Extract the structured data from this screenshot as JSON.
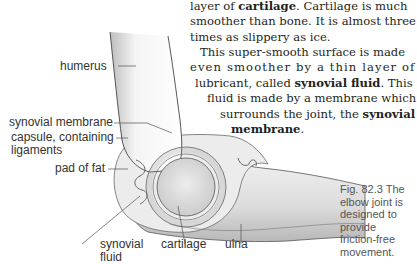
{
  "text": {
    "p1": {
      "l1_a": "layer of ",
      "l1_b": "cartilage",
      "l1_c": ". Cartilage is much",
      "l2": "smoother than bone. It is almost three",
      "l3": "times as slippery as ice."
    },
    "p2": {
      "l1": "This super-smooth surface is made",
      "l2": "even smoother by a thin layer of",
      "l3_a": "lubricant, called ",
      "l3_b": "synovial fluid",
      "l3_c": ". This",
      "l4": "fluid is made by a membrane which",
      "l5_a": "surrounds the joint, the ",
      "l5_b": "synovial",
      "l6_a": "membrane",
      "l6_b": "."
    }
  },
  "labels": {
    "humerus": "humerus",
    "synovial_membrane": "synovial membrane",
    "capsule_1": "capsule, containing",
    "capsule_2": "ligaments",
    "pad_of_fat": "pad of fat",
    "synovial_fluid_1": "synovial",
    "synovial_fluid_2": "fluid",
    "cartilage": "cartilage",
    "ulna": "ulna"
  },
  "caption": {
    "l1": "Fig. 82.3  The",
    "l2": "elbow joint is",
    "l3": "designed to",
    "l4": "provide",
    "l5": "friction-free",
    "l6": "movement."
  },
  "colors": {
    "text": "#231f20",
    "label": "#333333",
    "caption": "#555555",
    "bone": "#e4e4e4",
    "outline": "#444444"
  }
}
